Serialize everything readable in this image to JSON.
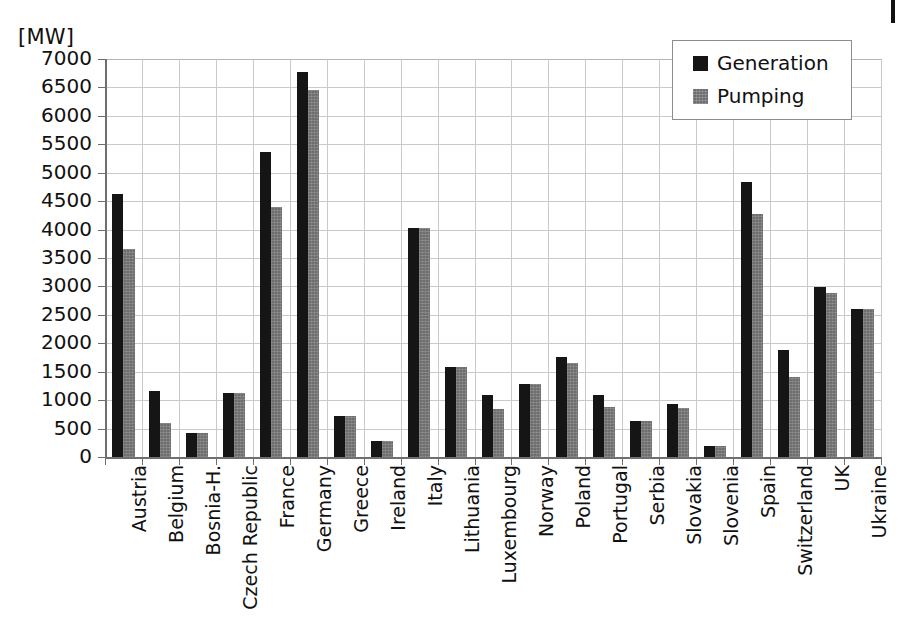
{
  "chart_data": {
    "type": "bar",
    "title": "",
    "subtitle": "",
    "unit_label": "[MW]",
    "xlabel": "",
    "ylabel": "",
    "ylim": [
      0,
      7000
    ],
    "ytick_step": 500,
    "yticks": [
      7000,
      6500,
      6000,
      5500,
      5000,
      4500,
      4000,
      3500,
      3000,
      2500,
      2000,
      1500,
      1000,
      500,
      0
    ],
    "ytick_labels": [
      "7000",
      "6500",
      "6000",
      "5500",
      "5000",
      "4500",
      "4000",
      "3500",
      "3000",
      "2500",
      "2000",
      "1500",
      "1000",
      "500",
      "0"
    ],
    "grid": true,
    "grid_axis": "both",
    "legend_position": "top-right",
    "categories": [
      "Austria",
      "Belgium",
      "Bosnia-H.",
      "Czech Republic",
      "France",
      "Germany",
      "Greece",
      "Ireland",
      "Italy",
      "Lithuania",
      "Luxembourg",
      "Norway",
      "Poland",
      "Portugal",
      "Serbia",
      "Slovakia",
      "Slovenia",
      "Spain",
      "Switzerland",
      "UK",
      "Ukraine"
    ],
    "series": [
      {
        "name": "Generation",
        "color": "#151515",
        "values": [
          4620,
          1160,
          420,
          1130,
          5370,
          6780,
          730,
          290,
          4020,
          1590,
          1090,
          1280,
          1760,
          1090,
          640,
          930,
          185,
          4840,
          1880,
          2990,
          2600
        ]
      },
      {
        "name": "Pumping",
        "color": "#6e6e6e",
        "values": [
          3650,
          600,
          420,
          1120,
          4390,
          6450,
          730,
          290,
          4020,
          1590,
          850,
          1280,
          1660,
          880,
          640,
          870,
          185,
          4280,
          1400,
          2890,
          2600
        ]
      }
    ]
  },
  "legend": {
    "items": [
      {
        "label": "Generation",
        "swatch": "generation"
      },
      {
        "label": "Pumping",
        "swatch": "pumping"
      }
    ]
  }
}
